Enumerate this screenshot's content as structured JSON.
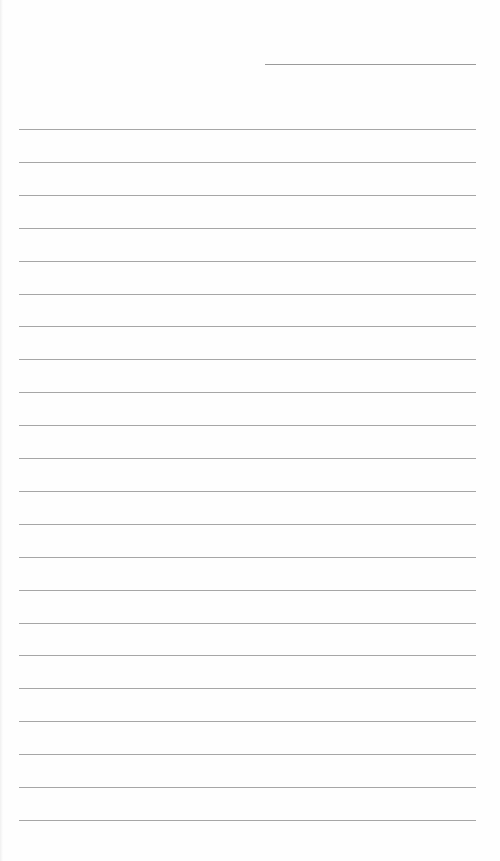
{
  "page": {
    "type": "lined-writing-sheet",
    "background_color": "#fefefe",
    "line_color": "#a6a6a6"
  },
  "header": {
    "name_line": {
      "x": 265,
      "y": 64,
      "width": 211
    }
  },
  "ruled_lines": {
    "count": 22,
    "start_y": 129,
    "spacing": 32.9,
    "x": 19,
    "width": 457
  }
}
